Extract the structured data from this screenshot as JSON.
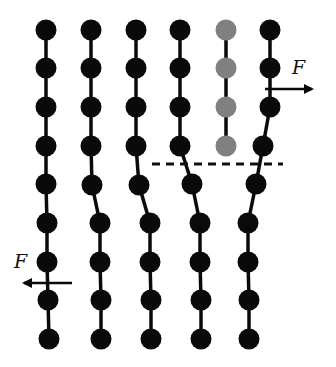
{
  "diagram": {
    "colors": {
      "bead": "#0a0a0a",
      "bead_highlight": "#808080",
      "bond": "#0a0a0a",
      "dashed_line": "#111111",
      "arrow": "#0a0a0a"
    },
    "bead_radius": 10.5,
    "chains": [
      {
        "id": "chain-1",
        "highlight": false,
        "beads": [
          [
            46,
            30
          ],
          [
            46,
            68
          ],
          [
            46,
            107
          ],
          [
            46,
            146
          ],
          [
            46,
            184
          ],
          [
            47,
            223
          ],
          [
            47,
            262
          ],
          [
            48,
            300
          ],
          [
            49,
            339
          ]
        ]
      },
      {
        "id": "chain-2",
        "highlight": false,
        "beads": [
          [
            91,
            30
          ],
          [
            91,
            68
          ],
          [
            91,
            107
          ],
          [
            91,
            146
          ],
          [
            92,
            185
          ],
          [
            100,
            223
          ],
          [
            100,
            262
          ],
          [
            101,
            300
          ],
          [
            101,
            339
          ]
        ]
      },
      {
        "id": "chain-3",
        "highlight": false,
        "beads": [
          [
            136,
            30
          ],
          [
            136,
            68
          ],
          [
            136,
            107
          ],
          [
            136,
            146
          ],
          [
            139,
            185
          ],
          [
            150,
            223
          ],
          [
            150,
            262
          ],
          [
            151,
            300
          ],
          [
            151,
            339
          ]
        ]
      },
      {
        "id": "chain-4",
        "highlight": false,
        "beads": [
          [
            180,
            30
          ],
          [
            180,
            68
          ],
          [
            180,
            107
          ],
          [
            180,
            146
          ],
          [
            192,
            184
          ],
          [
            200,
            223
          ],
          [
            200,
            262
          ],
          [
            201,
            300
          ],
          [
            201,
            339
          ]
        ]
      },
      {
        "id": "chain-5",
        "highlight": true,
        "beads": [
          [
            226,
            30
          ],
          [
            226,
            68
          ],
          [
            226,
            107
          ],
          [
            226,
            146
          ]
        ]
      },
      {
        "id": "chain-6",
        "highlight": false,
        "beads": [
          [
            270,
            30
          ],
          [
            270,
            68
          ],
          [
            270,
            107
          ],
          [
            263,
            146
          ],
          [
            256,
            184
          ],
          [
            248,
            223
          ],
          [
            248,
            262
          ],
          [
            249,
            300
          ],
          [
            249,
            339
          ]
        ]
      }
    ],
    "interface_line": {
      "x1": 152,
      "y1": 164,
      "x2": 283,
      "y2": 164,
      "dash": "8 6"
    },
    "forces": [
      {
        "id": "force-right",
        "label": "F",
        "x1": 265,
        "y1": 89,
        "x2": 312,
        "y2": 89,
        "label_x": 292,
        "label_y": 74
      },
      {
        "id": "force-left",
        "label": "F",
        "x1": 72,
        "y1": 283,
        "x2": 24,
        "y2": 283,
        "label_x": 14,
        "label_y": 268
      }
    ]
  }
}
